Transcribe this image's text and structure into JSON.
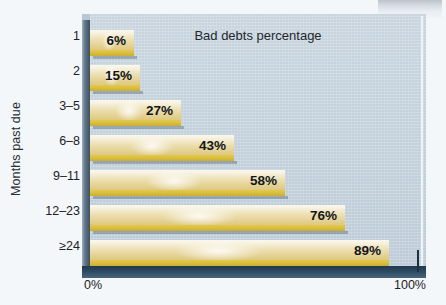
{
  "chart_data": {
    "type": "bar",
    "orientation": "horizontal",
    "title": "Bad debts percentage",
    "xlabel": "",
    "ylabel": "Months past due",
    "categories": [
      "1",
      "2",
      "3–5",
      "6–8",
      "9–11",
      "12–23",
      "≥24"
    ],
    "values": [
      6,
      15,
      27,
      43,
      58,
      76,
      89
    ],
    "value_labels": [
      "6%",
      "15%",
      "27%",
      "43%",
      "58%",
      "76%",
      "89%"
    ],
    "xlim": [
      0,
      100
    ],
    "x_tick_labels": [
      "0%",
      "100%"
    ],
    "grid": false,
    "legend": null,
    "colors": {
      "bar_top": "#fbf8ee",
      "bar_mid": "#ecdfb0",
      "bar_bottom": "#ddc97f",
      "bar_stripe": "#d8bd3d",
      "plot_background": "#c4d2dc",
      "axis_spine": "#2c4a61",
      "page_background": "#f4f7fa",
      "text": "#1c2124"
    }
  },
  "bars": [
    {
      "category": "1",
      "label": "6%",
      "value": 6
    },
    {
      "category": "2",
      "label": "15%",
      "value": 15
    },
    {
      "category": "3–5",
      "label": "27%",
      "value": 27
    },
    {
      "category": "6–8",
      "label": "43%",
      "value": 43
    },
    {
      "category": "9–11",
      "label": "58%",
      "value": 58
    },
    {
      "category": "12–23",
      "label": "76%",
      "value": 76
    },
    {
      "category": "≥24",
      "label": "89%",
      "value": 89
    }
  ],
  "axes": {
    "y_title": "Months past due",
    "x_min_label": "0%",
    "x_max_label": "100%"
  }
}
